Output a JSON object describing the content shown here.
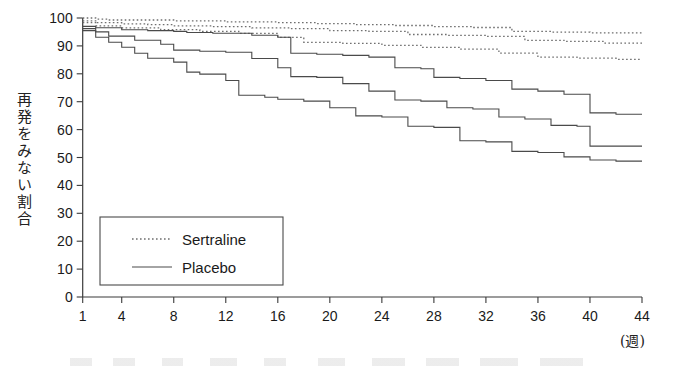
{
  "figure": {
    "ylabel_vertical": "再発をみない割合",
    "x_unit_label": "(週)"
  },
  "legend": {
    "entries": [
      {
        "label": "Sertraline",
        "style": "dotted"
      },
      {
        "label": "Placebo",
        "style": "solid"
      }
    ]
  },
  "chart_data": {
    "type": "line",
    "title": "",
    "xlabel": "(週)",
    "ylabel": "再発をみない割合",
    "xlim": [
      1,
      44
    ],
    "ylim": [
      0,
      100
    ],
    "grid": false,
    "legend_position": "inside-lower-left",
    "x_ticks": [
      1,
      4,
      8,
      12,
      16,
      20,
      24,
      28,
      32,
      36,
      40,
      44
    ],
    "x_tick_labels": [
      "1",
      "4",
      "8",
      "12",
      "16",
      "20",
      "24",
      "28",
      "32",
      "36",
      "40",
      "44"
    ],
    "y_ticks": [
      0,
      10,
      20,
      30,
      40,
      50,
      60,
      70,
      80,
      90,
      100
    ],
    "y_tick_labels": [
      "0",
      "10",
      "20",
      "30",
      "40",
      "50",
      "60",
      "70",
      "80",
      "90",
      "100"
    ],
    "step_shape": "hv",
    "series": [
      {
        "name": "Sertraline",
        "style": "dotted",
        "x": [
          1,
          2,
          3,
          5,
          8,
          12,
          16,
          19,
          22,
          25,
          28,
          31,
          34,
          37,
          40,
          44
        ],
        "values": [
          100,
          99.6,
          99.3,
          99.3,
          99.0,
          98.6,
          98.3,
          98.0,
          97.6,
          97.3,
          96.9,
          96.6,
          95.2,
          94.9,
          94.7,
          94.7
        ]
      },
      {
        "name": "Sertraline",
        "style": "dotted",
        "x": [
          1,
          2,
          4,
          6,
          8,
          11,
          14,
          17,
          20,
          23,
          26,
          29,
          32,
          35,
          38,
          41,
          44
        ],
        "values": [
          99.0,
          98.3,
          97.9,
          97.6,
          97.2,
          96.9,
          96.5,
          96.2,
          95.5,
          95.2,
          94.1,
          93.8,
          93.4,
          92.0,
          91.6,
          91.0,
          91.0
        ]
      },
      {
        "name": "Sertraline",
        "style": "dotted",
        "x": [
          1,
          2,
          4,
          7,
          10,
          13,
          16,
          18,
          21,
          24,
          27,
          30,
          33,
          36,
          39,
          42,
          44
        ],
        "values": [
          98.3,
          97.2,
          96.5,
          95.8,
          95.2,
          94.5,
          93.1,
          91.3,
          90.9,
          90.2,
          89.5,
          88.8,
          87.4,
          86.0,
          85.6,
          85.2,
          85.2
        ]
      },
      {
        "name": "Placebo",
        "style": "solid",
        "x": [
          1,
          2,
          4,
          6,
          8,
          9,
          11,
          14,
          16,
          17,
          19,
          21,
          23,
          25,
          27,
          28,
          30,
          32,
          34,
          36,
          38,
          40,
          42,
          44
        ],
        "values": [
          97.0,
          96.5,
          95.8,
          95.5,
          95.2,
          94.8,
          94.5,
          93.8,
          93.1,
          87.4,
          87.0,
          86.6,
          86.0,
          82.2,
          81.8,
          78.7,
          78.3,
          77.6,
          74.5,
          73.8,
          72.7,
          66.0,
          65.5,
          65.5
        ],
        "end_value": 65.5
      },
      {
        "name": "Placebo",
        "style": "solid",
        "x": [
          1,
          2,
          3,
          5,
          7,
          8,
          10,
          12,
          14,
          16,
          17,
          19,
          21,
          23,
          25,
          27,
          29,
          31,
          33,
          35,
          37,
          39,
          40,
          42,
          44
        ],
        "values": [
          96.2,
          95.0,
          93.5,
          92.0,
          90.6,
          88.5,
          88.1,
          87.7,
          85.5,
          82.2,
          79.0,
          78.7,
          76.5,
          73.8,
          70.6,
          70.2,
          67.8,
          67.4,
          64.5,
          63.8,
          61.5,
          61.2,
          54.1,
          54.1,
          54.1
        ],
        "end_value": 54.1
      },
      {
        "name": "Placebo",
        "style": "solid",
        "x": [
          1,
          2,
          3,
          4,
          5,
          6,
          8,
          9,
          10,
          12,
          13,
          15,
          16,
          18,
          20,
          22,
          24,
          26,
          28,
          30,
          32,
          34,
          36,
          38,
          40,
          42,
          44
        ],
        "values": [
          95.5,
          93.1,
          91.3,
          89.5,
          87.4,
          85.6,
          84.2,
          80.6,
          79.9,
          77.6,
          72.3,
          71.6,
          70.9,
          70.2,
          67.8,
          64.9,
          64.5,
          61.2,
          60.8,
          56.0,
          55.6,
          52.2,
          51.8,
          50.2,
          49.1,
          48.7,
          48.7
        ],
        "end_value": 48.7
      }
    ]
  },
  "colors": {
    "axis": "#3a3a3a",
    "solid_curve": "#4a4a4a",
    "dotted_curve": "#6f6f6f",
    "background": "#ffffff"
  }
}
